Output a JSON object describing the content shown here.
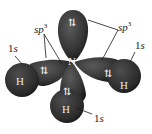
{
  "diagram": {
    "central_atom": "N",
    "hydrogens": [
      "H",
      "H",
      "H"
    ],
    "lone_pair_symbol": "⇅",
    "labels": {
      "sp3_left": {
        "base": "sp",
        "sup": "3"
      },
      "sp3_right": {
        "base": "sp",
        "sup": "3"
      },
      "s_left": {
        "num": "1",
        "orb": "s"
      },
      "s_right": {
        "num": "1",
        "orb": "s"
      },
      "s_bottom": {
        "num": "1",
        "orb": "s"
      }
    },
    "colors": {
      "lobe": "#3a3a3a",
      "lobe_dark": "#1e1e1e",
      "hydrogen": "#2e2e2e",
      "line": "#1a1a1a",
      "text_on_lobe": "#e8e8e8"
    }
  }
}
